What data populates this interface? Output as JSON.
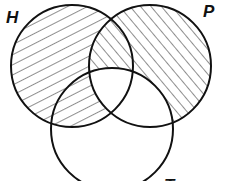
{
  "diagram": {
    "type": "venn",
    "sets": [
      {
        "id": "H",
        "label": "H",
        "cx": 72,
        "cy": 66,
        "r": 61
      },
      {
        "id": "P",
        "label": "P",
        "cx": 150,
        "cy": 66,
        "r": 61
      },
      {
        "id": "T",
        "label": "T",
        "cx": 112,
        "cy": 129,
        "r": 61
      }
    ],
    "regions": [
      {
        "region": "H only",
        "shading": "hatch-ascending"
      },
      {
        "region": "H and T, not P",
        "shading": "hatch-ascending"
      },
      {
        "region": "H and P, not T",
        "shading": "hatch-descending"
      },
      {
        "region": "P only",
        "shading": "hatch-descending"
      },
      {
        "region": "H and P and T",
        "shading": "none"
      },
      {
        "region": "P and T, not H",
        "shading": "none"
      },
      {
        "region": "T only",
        "shading": "none"
      }
    ],
    "colors": {
      "stroke": "#111111",
      "hatch": "#333333",
      "background": "#ffffff"
    }
  },
  "labels": {
    "h": "H",
    "p": "P",
    "t": "T"
  }
}
